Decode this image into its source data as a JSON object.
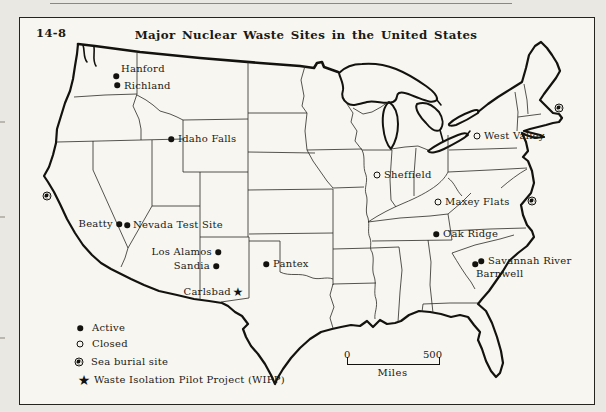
{
  "figure_label": "14-8",
  "title": "Major Nuclear Waste Sites in the United States",
  "sites": [
    {
      "name": "Hanford",
      "type": "active"
    },
    {
      "name": "Richland",
      "type": "active"
    },
    {
      "name": "Idaho Falls",
      "type": "active"
    },
    {
      "name": "Beatty",
      "type": "active"
    },
    {
      "name": "Nevada Test Site",
      "type": "active"
    },
    {
      "name": "Los Alamos",
      "type": "active"
    },
    {
      "name": "Sandia",
      "type": "active"
    },
    {
      "name": "Carlsbad",
      "type": "wipp"
    },
    {
      "name": "Pantex",
      "type": "active"
    },
    {
      "name": "Sheffield",
      "type": "closed"
    },
    {
      "name": "Maxey Flats",
      "type": "closed"
    },
    {
      "name": "West Valley",
      "type": "closed"
    },
    {
      "name": "Oak Ridge",
      "type": "active"
    },
    {
      "name": "Savannah River",
      "type": "active"
    },
    {
      "name": "Barnwell",
      "type": "active"
    }
  ],
  "sea_burial_marker_count": 3,
  "legend": {
    "items": [
      {
        "symbol": "active",
        "label": "Active"
      },
      {
        "symbol": "closed",
        "label": "Closed"
      },
      {
        "symbol": "sea-burial",
        "label": "Sea burial site"
      },
      {
        "symbol": "wipp-star",
        "label": "Waste Isolation Pilot Project (WIPP)"
      }
    ]
  },
  "scale_bar": {
    "start": "0",
    "end": "500",
    "unit": "Miles"
  },
  "colors": {
    "ink": "#14120e",
    "paper": "#f7f6f0",
    "margin": "#eae8e2"
  }
}
